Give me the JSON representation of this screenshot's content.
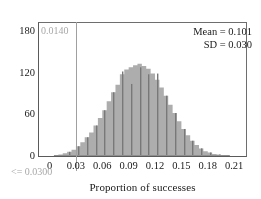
{
  "chart_data": {
    "type": "bar",
    "title": "",
    "subtitle": "",
    "xlabel": "Proportion of successes",
    "ylabel": "",
    "xlim": [
      -0.012,
      0.2235
    ],
    "ylim": [
      0,
      192
    ],
    "grid": false,
    "legend_position": "top-right",
    "x_ticks": [
      "0",
      "0.03",
      "0.06",
      "0.09",
      "0.12",
      "0.15",
      "0.18",
      "0.21"
    ],
    "x_tick_values": [
      0,
      0.03,
      0.06,
      0.09,
      0.12,
      0.15,
      0.18,
      0.21
    ],
    "y_ticks": [
      "0",
      "60",
      "120",
      "180"
    ],
    "y_tick_values": [
      0,
      60,
      120,
      180
    ],
    "bin_width": 0.005,
    "categories": [
      0.0075,
      0.0125,
      0.0175,
      0.0225,
      0.0275,
      0.0325,
      0.0375,
      0.0425,
      0.0475,
      0.0525,
      0.0575,
      0.0625,
      0.0675,
      0.0725,
      0.0775,
      0.0825,
      0.0875,
      0.0925,
      0.0975,
      0.1025,
      0.1075,
      0.1125,
      0.1175,
      0.1225,
      0.1275,
      0.1325,
      0.1375,
      0.1425,
      0.1475,
      0.1525,
      0.1575,
      0.1625,
      0.1675,
      0.1725,
      0.1775,
      0.1825,
      0.1875,
      0.1925,
      0.1975,
      0.2025
    ],
    "values": [
      1,
      2,
      4,
      6,
      9,
      14,
      20,
      27,
      34,
      44,
      55,
      66,
      79,
      92,
      103,
      118,
      125,
      128,
      131,
      133,
      130,
      126,
      119,
      110,
      99,
      87,
      74,
      62,
      50,
      39,
      30,
      22,
      16,
      11,
      7,
      5,
      3,
      2,
      1,
      1
    ],
    "tick_bars": {
      "x": [
        0.0225,
        0.0325,
        0.0425,
        0.0525,
        0.0625,
        0.0725,
        0.0825,
        0.0925,
        0.1025,
        0.1125,
        0.1225,
        0.1325,
        0.1425,
        0.1525,
        0.1625,
        0.1725,
        0.1825,
        0.1925
      ],
      "values": [
        6,
        14,
        27,
        44,
        66,
        92,
        122,
        104,
        128,
        118,
        119,
        87,
        62,
        39,
        22,
        11,
        5,
        2
      ]
    },
    "annotations": [
      {
        "name": "mean",
        "text": "Mean = 0.101",
        "value": 0.101
      },
      {
        "name": "sd",
        "text": "SD = 0.030",
        "value": 0.03
      },
      {
        "name": "tail-probability",
        "text": "0.0140",
        "value": 0.014
      },
      {
        "name": "threshold",
        "text": "<= 0.0300",
        "value": 0.03
      }
    ],
    "reference_line": {
      "x": 0.03,
      "color": "#a0a0a0"
    },
    "colors": {
      "bar_fill": "#adadad",
      "bar_line": "#787878",
      "axis": "#5a5a5a",
      "annotation_gray": "#a8a8a8",
      "text": "#1a1a1a"
    }
  },
  "axis": {
    "x_title": "Proportion of successes"
  },
  "stats": {
    "mean_label": "Mean = 0.101",
    "sd_label": "SD = 0.030"
  },
  "labels": {
    "tail_probability": "0.0140",
    "threshold": "<= 0.0300"
  }
}
